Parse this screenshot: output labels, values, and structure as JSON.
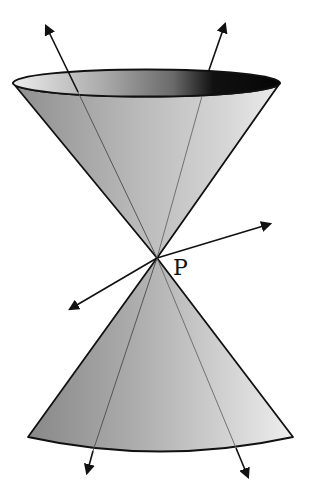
{
  "diagram": {
    "event_label": "P",
    "apex": {
      "x": 157,
      "y": 258
    },
    "colors": {
      "outline": "#111111",
      "cone_dark": "#8a8a8a",
      "cone_mid": "#b4b4b4",
      "cone_light": "#e6e6e6",
      "rim_dark": "#0a0a0a",
      "rim_light": "#e8e8e8"
    },
    "future_cone": {
      "rim": {
        "cx": 146.5,
        "cy": 83,
        "rx": 133.5,
        "ry": 13.5
      }
    },
    "past_cone": {
      "base_left": {
        "x": 28,
        "y": 437
      },
      "base_right": {
        "x": 293,
        "y": 437
      },
      "base_bottom_y": 452
    },
    "arrows": [
      {
        "name": "future-left-worldline",
        "from": [
          157,
          258
        ],
        "to": [
          45,
          24
        ]
      },
      {
        "name": "future-right-worldline",
        "from": [
          157,
          258
        ],
        "to": [
          226,
          22
        ]
      },
      {
        "name": "spacelike-right",
        "from": [
          157,
          258
        ],
        "to": [
          272,
          223
        ]
      },
      {
        "name": "spacelike-left",
        "from": [
          157,
          258
        ],
        "to": [
          68,
          310
        ]
      },
      {
        "name": "past-left-worldline",
        "from": [
          157,
          258
        ],
        "to": [
          86,
          475
        ]
      },
      {
        "name": "past-right-worldline",
        "from": [
          157,
          258
        ],
        "to": [
          249,
          479
        ]
      }
    ]
  }
}
